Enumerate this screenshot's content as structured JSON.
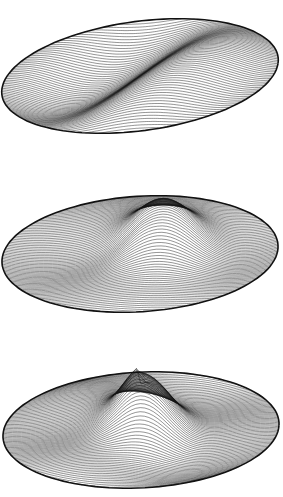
{
  "figure": {
    "background": "#ffffff",
    "line_color": "#111111",
    "plots": [
      {
        "id": "mode-1",
        "description": "Line-drawn 3D surface over elliptical domain: one diagonal ridge/fold (single nodal line)",
        "top": 12,
        "height": 135,
        "cx": 140,
        "cy": 76,
        "rx": 138,
        "ry": 56,
        "tilt": -0.22,
        "mode": [
          1,
          0
        ],
        "amplitude": 24,
        "lines": 70
      },
      {
        "id": "mode-2",
        "description": "Line-drawn 3D surface over elliptical domain: central peak with two side troughs",
        "top": 188,
        "height": 135,
        "cx": 140,
        "cy": 254,
        "rx": 138,
        "ry": 58,
        "tilt": -0.1,
        "mode": [
          2,
          1
        ],
        "amplitude": 30,
        "lines": 80
      },
      {
        "id": "mode-3",
        "description": "Line-drawn 3D surface over elliptical domain: central sharp peak with multiple surrounding ridges and troughs",
        "top": 364,
        "height": 133,
        "cx": 141,
        "cy": 430,
        "rx": 138,
        "ry": 58,
        "tilt": -0.08,
        "mode": [
          3,
          2
        ],
        "amplitude": 32,
        "lines": 90
      }
    ]
  }
}
